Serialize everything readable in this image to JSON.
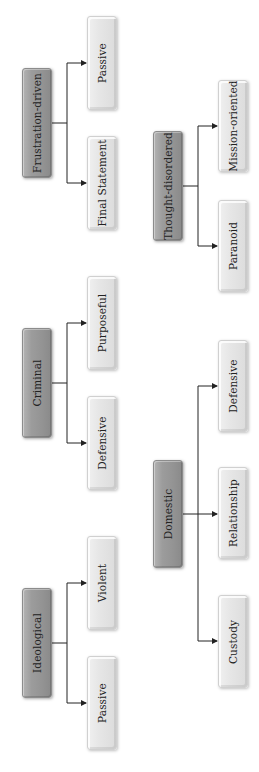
{
  "diagram": {
    "orientation": "rotated-90-ccw",
    "colors": {
      "parent_fill": "#999999",
      "child_fill": "#e4e4e4",
      "connector": "#222222",
      "text": "#222222"
    },
    "groups": [
      {
        "parent": "Frustration-driven",
        "children": [
          "Passive",
          "Final Statement"
        ]
      },
      {
        "parent": "Thought-disordered",
        "children": [
          "Mission-oriented",
          "Paranoid"
        ]
      },
      {
        "parent": "Criminal",
        "children": [
          "Purposeful",
          "Defensive"
        ]
      },
      {
        "parent": "Domestic",
        "children": [
          "Defensive",
          "Relationship",
          "Custody"
        ]
      },
      {
        "parent": "Ideological",
        "children": [
          "Violent",
          "Passive"
        ]
      }
    ]
  }
}
